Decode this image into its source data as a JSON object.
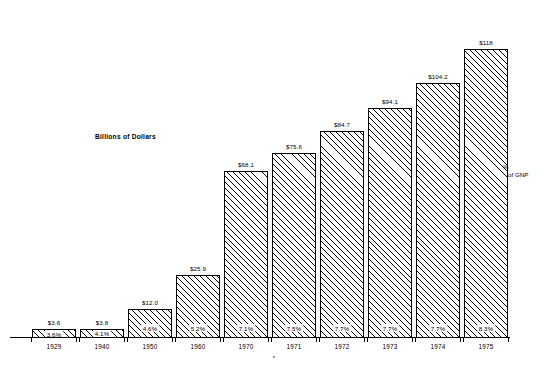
{
  "chart_data": {
    "type": "bar",
    "title": "",
    "ylabel": "Billions of Dollars",
    "xlabel": "",
    "categories": [
      "1929",
      "1940",
      "1950",
      "1960",
      "1970",
      "1971",
      "1972",
      "1973",
      "1974",
      "1975"
    ],
    "values": [
      3.6,
      3.8,
      12.0,
      25.9,
      68.1,
      75.6,
      84.7,
      94.1,
      104.2,
      118
    ],
    "value_labels": [
      "$3.6",
      "$3.8",
      "$12.0",
      "$25.9",
      "$68.1",
      "$75.6",
      "$84.7",
      "$94.1",
      "$104.2",
      "$118"
    ],
    "series": [
      {
        "name": "Billions of Dollars",
        "values": [
          3.6,
          3.8,
          12.0,
          25.9,
          68.1,
          75.6,
          84.7,
          94.1,
          104.2,
          118
        ]
      },
      {
        "name": "% of GNP",
        "values": [
          3.6,
          4.1,
          4.6,
          5.2,
          7.1,
          7.5,
          7.7,
          7.7,
          7.7,
          8.3
        ],
        "labels": [
          "3.6%",
          "4.1%",
          "4.6%",
          "5.2%",
          "7.1%",
          "7.5%",
          "7.7%",
          "7.7%",
          "7.7%",
          "8.3%"
        ]
      }
    ],
    "ylim": [
      0,
      125
    ],
    "grid": false,
    "legend": "none",
    "annotations": [
      "% of GNP"
    ]
  },
  "annotations": {
    "y_axis_title": "Billions of Dollars",
    "gnp_line1": "%",
    "gnp_line2": "of GNP"
  },
  "bars": [
    {
      "year": "1929",
      "value_label": "$3.6",
      "pct_label": "3.6%",
      "value": 3.6
    },
    {
      "year": "1940",
      "value_label": "$3.8",
      "pct_label": "4.1%",
      "value": 3.8
    },
    {
      "year": "1950",
      "value_label": "$12.0",
      "pct_label": "4.6%",
      "value": 12.0
    },
    {
      "year": "1960",
      "value_label": "$25.9",
      "pct_label": "5.2%",
      "value": 25.9
    },
    {
      "year": "1970",
      "value_label": "$68.1",
      "pct_label": "7.1%",
      "value": 68.1
    },
    {
      "year": "1971",
      "value_label": "$75.6",
      "pct_label": "7.5%",
      "value": 75.6
    },
    {
      "year": "1972",
      "value_label": "$84.7",
      "pct_label": "7.7%",
      "value": 84.7
    },
    {
      "year": "1973",
      "value_label": "$94.1",
      "pct_label": "7.7%",
      "value": 94.1
    },
    {
      "year": "1974",
      "value_label": "$104.2",
      "pct_label": "7.7%",
      "value": 104.2
    },
    {
      "year": "1975",
      "value_label": "$118",
      "pct_label": "8.3%",
      "value": 118
    }
  ],
  "colors": {
    "ink": "#000000",
    "background": "#ffffff"
  }
}
